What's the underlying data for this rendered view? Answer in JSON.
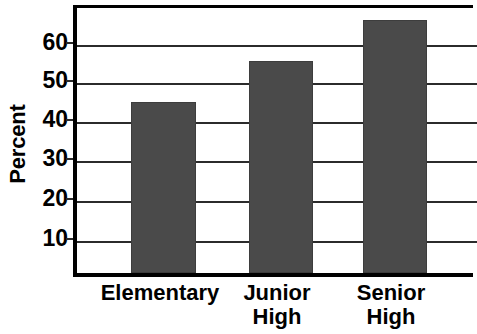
{
  "chart_data": {
    "type": "bar",
    "title": "",
    "xlabel": "",
    "ylabel": "Percent",
    "categories": [
      "Elementary",
      "Junior High",
      "Senior High"
    ],
    "category_lines": [
      [
        "Elementary"
      ],
      [
        "Junior",
        "High"
      ],
      [
        "Senior",
        "High"
      ]
    ],
    "values": [
      43.5,
      54,
      64.5
    ],
    "ylim": [
      0,
      69
    ],
    "yticks": [
      10,
      20,
      30,
      40,
      50,
      60
    ],
    "ytick_labels": [
      "10",
      "20",
      "30",
      "40",
      "50",
      "60"
    ],
    "grid": true,
    "legend": "none",
    "bar_color": "#4a4a4a",
    "axis_color": "#000000"
  },
  "axis": {
    "y_title": "Percent",
    "ticks": [
      {
        "label": "60",
        "value": 60
      },
      {
        "label": "50",
        "value": 50
      },
      {
        "label": "40",
        "value": 40
      },
      {
        "label": "30",
        "value": 30
      },
      {
        "label": "20",
        "value": 20
      },
      {
        "label": "10",
        "value": 10
      }
    ]
  },
  "bars": [
    {
      "label": "Elementary",
      "label_lines": "Elementary",
      "value": 43.5
    },
    {
      "label": "Junior High",
      "label_lines": "Junior\nHigh",
      "value": 54
    },
    {
      "label": "Senior High",
      "label_lines": "Senior\nHigh",
      "value": 64.5
    }
  ]
}
